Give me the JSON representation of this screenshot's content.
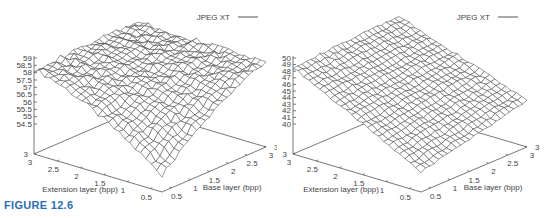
{
  "figure": {
    "caption": "FIGURE 12.6"
  },
  "chart_data": [
    {
      "type": "surface",
      "title": "",
      "legend": [
        "JPEG XT"
      ],
      "legend_position": "top-right",
      "xlabel": "Extension layer (bpp)",
      "ylabel": "Base layer (bpp)",
      "zlabel": "",
      "x_ticks": [
        "0.5",
        "1",
        "1.5",
        "2",
        "2.5",
        "3"
      ],
      "y_ticks": [
        "0.5",
        "1",
        "1.5",
        "2",
        "2.5",
        "3"
      ],
      "z_ticks": [
        "54.5",
        "55",
        "55.5",
        "56",
        "56.5",
        "57",
        "57.5",
        "58",
        "58.5",
        "59"
      ],
      "xlim": [
        0.25,
        3
      ],
      "ylim": [
        0.25,
        3
      ],
      "zlim": [
        54.5,
        59
      ],
      "grid": false,
      "surface_description": "Mostly flat plateau around 58-58.5 dB at high extension/base rates, dropping steeply to ~54 where both extension and base layer rates are low (front corner).",
      "corner_values": {
        "ext_3_base_0.25": 58.1,
        "ext_3_base_3": 58.6,
        "ext_0.25_base_3": 58.2,
        "ext_0.25_base_0.25": 53.8
      }
    },
    {
      "type": "surface",
      "title": "",
      "legend": [
        "JPEG XT"
      ],
      "legend_position": "top-right",
      "xlabel": "Extension layer (bpp)",
      "ylabel": "Base layer (bpp)",
      "zlabel": "",
      "x_ticks": [
        "0.5",
        "1",
        "1.5",
        "2",
        "2.5",
        "3"
      ],
      "y_ticks": [
        "0.5",
        "1",
        "1.5",
        "2",
        "2.5",
        "3"
      ],
      "z_ticks": [
        "40",
        "41",
        "42",
        "43",
        "44",
        "45",
        "46",
        "47",
        "48",
        "49",
        "50"
      ],
      "xlim": [
        0.25,
        3
      ],
      "ylim": [
        0.25,
        3
      ],
      "zlim": [
        40,
        50
      ],
      "grid": false,
      "surface_description": "Tilted sheet: highest (~49-50) at high extension / low base corner, decreasing toward low extension rates (~40-41) with a ridge along the base axis.",
      "corner_values": {
        "ext_3_base_0.25": 48.6,
        "ext_3_base_3": 49.5,
        "ext_0.25_base_3": 42.5,
        "ext_0.25_base_0.25": 38.5
      }
    }
  ]
}
